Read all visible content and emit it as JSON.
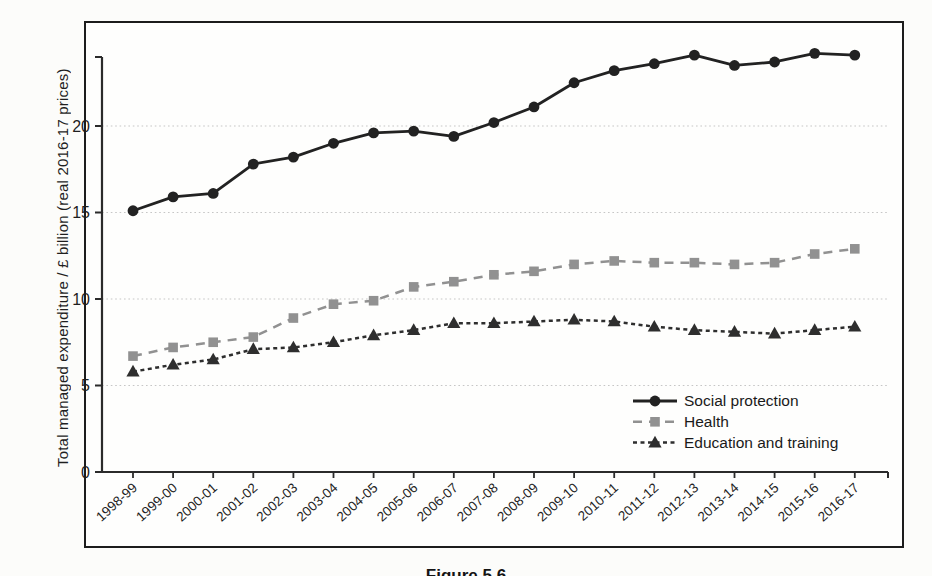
{
  "figure": {
    "caption": "Figure 5.6"
  },
  "chart_data": {
    "type": "line",
    "title": "",
    "xlabel": "",
    "ylabel": "Total managed expenditure / £ billion (real 2016-17 prices)",
    "categories": [
      "1998-99",
      "1999-00",
      "2000-01",
      "2001-02",
      "2002-03",
      "2003-04",
      "2004-05",
      "2005-06",
      "2006-07",
      "2007-08",
      "2008-09",
      "2009-10",
      "2010-11",
      "2011-12",
      "2012-13",
      "2013-14",
      "2014-15",
      "2015-16",
      "2016-17"
    ],
    "series": [
      {
        "name": "Social protection",
        "marker": "circle",
        "line": "solid",
        "color": "#222222",
        "values": [
          15.1,
          15.9,
          16.1,
          17.8,
          18.2,
          19.0,
          19.6,
          19.7,
          19.4,
          20.2,
          21.1,
          22.5,
          23.2,
          23.6,
          24.1,
          23.5,
          23.7,
          24.2,
          24.1
        ]
      },
      {
        "name": "Health",
        "marker": "square",
        "line": "dashed",
        "color": "#919191",
        "values": [
          6.7,
          7.2,
          7.5,
          7.8,
          8.9,
          9.7,
          9.9,
          10.7,
          11.0,
          11.4,
          11.6,
          12.0,
          12.2,
          12.1,
          12.1,
          12.0,
          12.1,
          12.6,
          12.9
        ]
      },
      {
        "name": "Education and training",
        "marker": "triangle",
        "line": "dense-dashed",
        "color": "#2e2e2e",
        "values": [
          5.8,
          6.2,
          6.5,
          7.1,
          7.2,
          7.5,
          7.9,
          8.2,
          8.6,
          8.6,
          8.7,
          8.8,
          8.7,
          8.4,
          8.2,
          8.1,
          8.0,
          8.2,
          8.4
        ]
      }
    ],
    "yticks": [
      0,
      5,
      10,
      15,
      20
    ],
    "ylim": [
      0,
      24.5
    ],
    "grid": "horizontal-dotted",
    "legend_position": "inside-lower-right"
  },
  "colors": {
    "border": "#1c1c1c",
    "axis": "#2b2b2b",
    "grid": "#c6c6c6",
    "text": "#1f1f1f",
    "paper": "#fcfcfa"
  }
}
